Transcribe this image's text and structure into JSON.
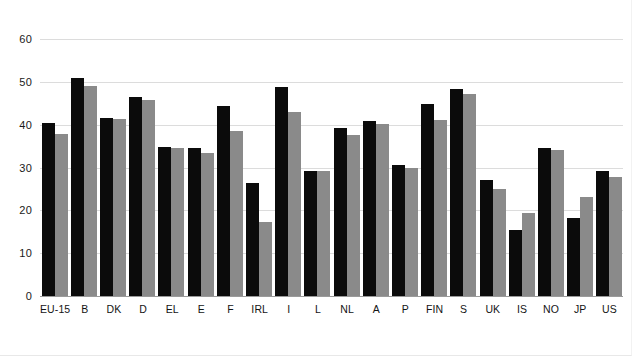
{
  "chart_data": {
    "type": "bar",
    "title": "",
    "subtitle": "",
    "xlabel": "",
    "ylabel": "",
    "ylim": [
      0,
      60
    ],
    "yticks": [
      0,
      10,
      20,
      30,
      40,
      50,
      60
    ],
    "ytick_labels": [
      "0",
      "10",
      "20",
      "30",
      "40",
      "50",
      "60"
    ],
    "grid": true,
    "legend": "none",
    "categories": [
      "EU-15",
      "B",
      "DK",
      "D",
      "EL",
      "E",
      "F",
      "IRL",
      "I",
      "L",
      "NL",
      "A",
      "P",
      "FIN",
      "S",
      "UK",
      "IS",
      "NO",
      "JP",
      "US"
    ],
    "series": [
      {
        "name": "series-1",
        "color": "#0b0b0b",
        "values": [
          40.5,
          50.8,
          41.5,
          46.5,
          34.8,
          34.5,
          44.4,
          26.5,
          48.7,
          29.2,
          39.3,
          40.8,
          30.5,
          44.8,
          48.3,
          27.0,
          15.4,
          34.5,
          18.3,
          29.2
        ]
      },
      {
        "name": "series-2",
        "color": "#8a8a8a",
        "values": [
          37.9,
          49.1,
          41.3,
          45.7,
          34.6,
          33.3,
          38.5,
          17.3,
          43.0,
          29.1,
          37.7,
          40.2,
          30.0,
          41.2,
          47.2,
          25.1,
          19.4,
          34.1,
          23.2,
          27.8
        ]
      }
    ]
  }
}
